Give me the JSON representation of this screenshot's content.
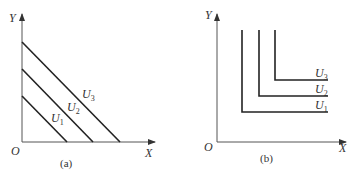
{
  "panels": [
    {
      "caption": "(a)",
      "y_axis_label": "Y",
      "x_axis_label": "X",
      "origin_label": "O",
      "curve_type": "linear indifference curves (perfect substitutes)",
      "curves": [
        {
          "name": "U",
          "sub": "1"
        },
        {
          "name": "U",
          "sub": "2"
        },
        {
          "name": "U",
          "sub": "3"
        }
      ]
    },
    {
      "caption": "(b)",
      "y_axis_label": "Y",
      "x_axis_label": "X",
      "origin_label": "O",
      "curve_type": "L-shaped indifference curves (perfect complements)",
      "curves": [
        {
          "name": "U",
          "sub": "1"
        },
        {
          "name": "U",
          "sub": "2"
        },
        {
          "name": "U",
          "sub": "3"
        }
      ]
    }
  ],
  "colors": {
    "line": "#222222",
    "axis": "#555555",
    "text": "#333333"
  }
}
